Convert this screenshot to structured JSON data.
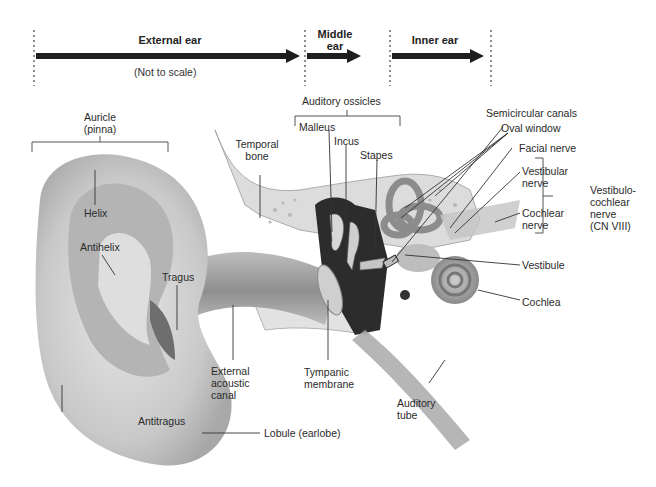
{
  "regions": {
    "external": "External ear",
    "middle_line1": "Middle",
    "middle_line2": "ear",
    "inner": "Inner ear",
    "scale_note": "(Not to scale)"
  },
  "labels": {
    "auricle_1": "Auricle",
    "auricle_2": "(pinna)",
    "helix": "Helix",
    "antihelix": "Antihelix",
    "tragus": "Tragus",
    "antitragus": "Antitragus",
    "lobule": "Lobule (earlobe)",
    "temporal_1": "Temporal",
    "temporal_2": "bone",
    "eac_1": "External",
    "eac_2": "acoustic",
    "eac_3": "canal",
    "tympanic_1": "Tympanic",
    "tympanic_2": "membrane",
    "ossicles": "Auditory ossicles",
    "malleus": "Malleus",
    "incus": "Incus",
    "stapes": "Stapes",
    "semicircular": "Semicircular canals",
    "oval": "Oval window",
    "facial": "Facial nerve",
    "vestibular_1": "Vestibular",
    "vestibular_2": "nerve",
    "cochlear_n_1": "Cochlear",
    "cochlear_n_2": "nerve",
    "vcn_1": "Vestibulo-",
    "vcn_2": "cochlear",
    "vcn_3": "nerve",
    "vcn_4": "(CN VIII)",
    "vestibule": "Vestibule",
    "cochlea": "Cochlea",
    "auditory_tube_1": "Auditory",
    "auditory_tube_2": "tube"
  }
}
